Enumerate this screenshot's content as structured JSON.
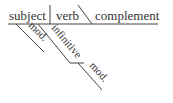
{
  "diagram": {
    "type": "sentence-diagram",
    "baseline": {
      "subject": "subject",
      "verb": "verb",
      "complement": "complement"
    },
    "modifiers": [
      {
        "label": "mod.",
        "attaches_to": "subject"
      },
      {
        "label": "infinitive",
        "attaches_to": "subject"
      },
      {
        "label": "mod.",
        "attaches_to": "infinitive"
      }
    ],
    "line_color": "#444444",
    "text_color": "#333333"
  }
}
